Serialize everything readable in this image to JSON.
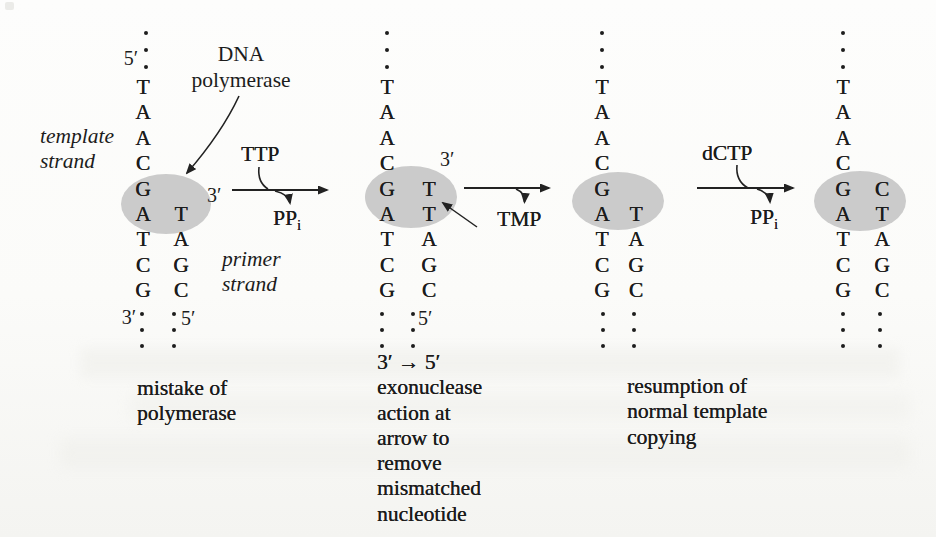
{
  "figure": {
    "colors": {
      "highlight": "#cbcbcb",
      "ink": "#1c1c1c",
      "paper": "#fbfbf9"
    },
    "labels": {
      "template_strand": [
        "template",
        "strand"
      ],
      "primer_strand": [
        "primer",
        "strand"
      ],
      "enzyme": [
        "DNA",
        "polymerase"
      ]
    },
    "reactions": {
      "r1": {
        "substrate": "TTP",
        "product": "PP",
        "product_sub": "i"
      },
      "r2": {
        "product": "TMP"
      },
      "r3": {
        "substrate": "dCTP",
        "product": "PP",
        "product_sub": "i"
      }
    },
    "captions": {
      "step1": [
        "mistake of",
        "polymerase"
      ],
      "step2": [
        "3′ → 5′",
        "exonuclease",
        "action at",
        "arrow to",
        "remove",
        "mismatched",
        "nucleotide"
      ],
      "step3": [
        "resumption of",
        "normal template",
        "copying"
      ]
    },
    "columns": [
      {
        "name": "stage-1-before-mistake",
        "template": [
          "T",
          "A",
          "A",
          "C",
          "G",
          "A",
          "T",
          "C",
          "G"
        ],
        "primer": [
          "T",
          "A",
          "G",
          "C"
        ],
        "primer_start_row": 5,
        "labels": [
          {
            "id": "top-5prime",
            "text": "5′"
          },
          {
            "id": "primer-3prime",
            "text": "3′"
          },
          {
            "id": "bottom-3prime",
            "text": "3′"
          },
          {
            "id": "bottom-5prime",
            "text": "5′"
          }
        ]
      },
      {
        "name": "stage-2-mismatched-T-added",
        "template": [
          "T",
          "A",
          "A",
          "C",
          "G",
          "A",
          "T",
          "C",
          "G"
        ],
        "primer": [
          "T",
          "T",
          "A",
          "G",
          "C"
        ],
        "primer_start_row": 4,
        "labels": [
          {
            "id": "primer-3prime",
            "text": "3′"
          },
          {
            "id": "bottom-5prime",
            "text": "5′"
          }
        ]
      },
      {
        "name": "stage-3-mismatch-removed",
        "template": [
          "T",
          "A",
          "A",
          "C",
          "G",
          "A",
          "T",
          "C",
          "G"
        ],
        "primer": [
          "T",
          "A",
          "G",
          "C"
        ],
        "primer_start_row": 5,
        "labels": []
      },
      {
        "name": "stage-4-correct-C-added",
        "template": [
          "T",
          "A",
          "A",
          "C",
          "G",
          "A",
          "T",
          "C",
          "G"
        ],
        "primer": [
          "C",
          "T",
          "A",
          "G",
          "C"
        ],
        "primer_start_row": 4,
        "labels": []
      }
    ]
  }
}
